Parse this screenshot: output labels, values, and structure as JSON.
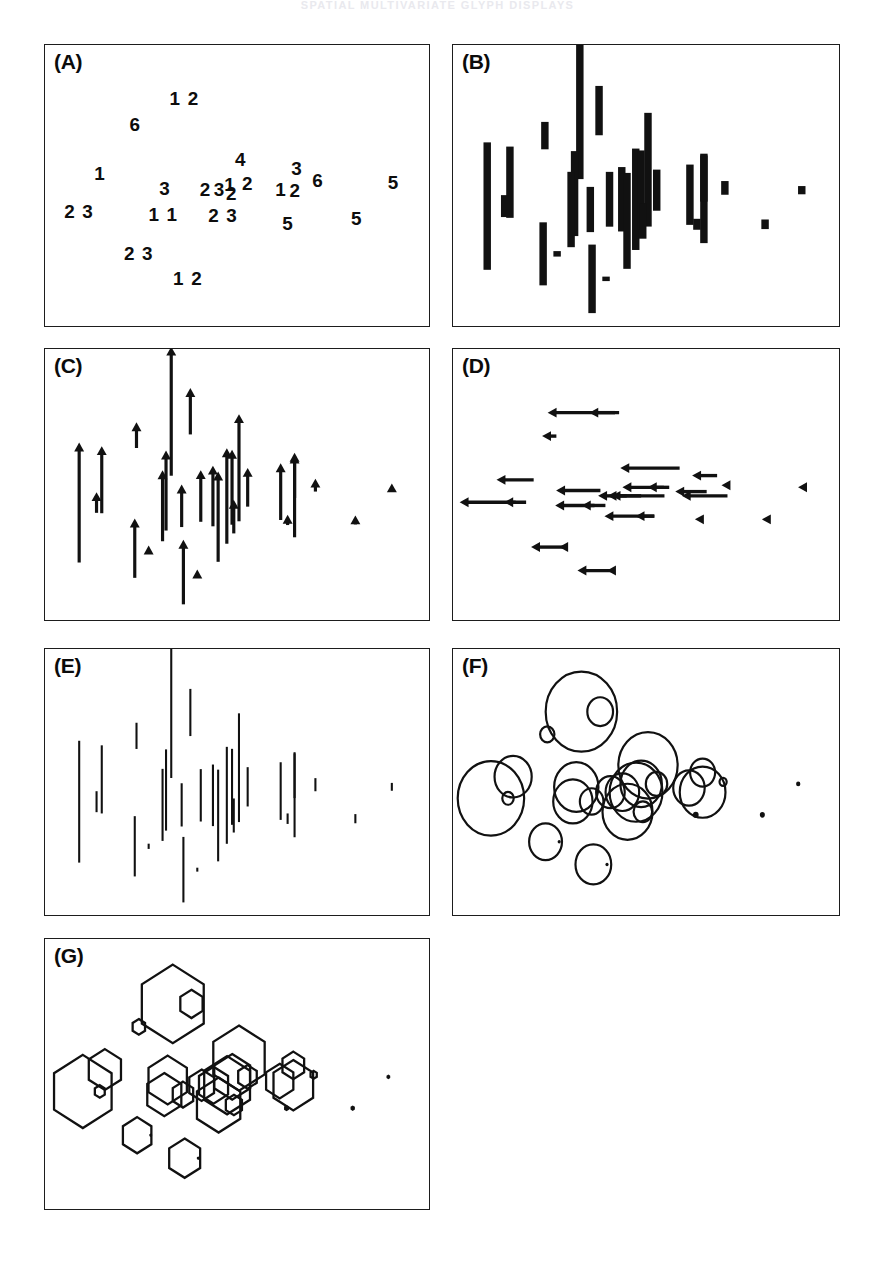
{
  "page": {
    "running_head": "SPATIAL MULTIVARIATE GLYPH DISPLAYS",
    "width": 875,
    "height": 1265,
    "ink_color": "#111111",
    "paper_color": "#ffffff"
  },
  "figure": {
    "panel_count": 7,
    "panel_geometry": [
      {
        "key": "A",
        "x": 44,
        "y": 44,
        "w": 386,
        "h": 283
      },
      {
        "key": "B",
        "x": 452,
        "y": 44,
        "w": 388,
        "h": 283
      },
      {
        "key": "C",
        "x": 44,
        "y": 348,
        "w": 386,
        "h": 273
      },
      {
        "key": "D",
        "x": 452,
        "y": 348,
        "w": 388,
        "h": 273
      },
      {
        "key": "E",
        "x": 44,
        "y": 648,
        "w": 386,
        "h": 268
      },
      {
        "key": "F",
        "x": 452,
        "y": 648,
        "w": 388,
        "h": 268
      },
      {
        "key": "G",
        "x": 44,
        "y": 938,
        "w": 386,
        "h": 272
      }
    ],
    "panels": [
      {
        "key": "A",
        "label": "(A)",
        "glyph": "digit"
      },
      {
        "key": "B",
        "label": "(B)",
        "glyph": "thick-bar"
      },
      {
        "key": "C",
        "label": "(C)",
        "glyph": "up-arrow"
      },
      {
        "key": "D",
        "label": "(D)",
        "glyph": "left-arrow"
      },
      {
        "key": "E",
        "label": "(E)",
        "glyph": "thin-line"
      },
      {
        "key": "F",
        "label": "(F)",
        "glyph": "circle"
      },
      {
        "key": "G",
        "label": "(G)",
        "glyph": "hexagon"
      }
    ]
  },
  "chart_data": {
    "type": "scatter",
    "title": "",
    "subtitle": "",
    "xlabel": "",
    "ylabel": "",
    "xlim": [
      0,
      100
    ],
    "ylim": [
      0,
      100
    ],
    "grid": false,
    "legend": "none",
    "note": "Seven panels show the same set of spatial sites encoded by seven different glyph types. Panel A prints a category digit at each site; panels B-G scale a glyph (bar, up-arrow, left-arrow, thin line, circle, hexagon) by the site value.",
    "sites": [
      {
        "id": 1,
        "x": 10.5,
        "y": 54.5,
        "digit": "1",
        "value": 0.52
      },
      {
        "id": 2,
        "x": 4.0,
        "y": 44.0,
        "digit": "2",
        "value": 0.93
      },
      {
        "id": 3,
        "x": 9.0,
        "y": 44.0,
        "digit": "3",
        "value": 0.16
      },
      {
        "id": 4,
        "x": 20.5,
        "y": 75.0,
        "digit": "6",
        "value": 0.2
      },
      {
        "id": 5,
        "x": 30.5,
        "y": 86.0,
        "digit": "1",
        "value": 1.0
      },
      {
        "id": 6,
        "x": 36.0,
        "y": 86.0,
        "digit": "2",
        "value": 0.36
      },
      {
        "id": 7,
        "x": 29.0,
        "y": 49.5,
        "digit": "3",
        "value": 0.62
      },
      {
        "id": 8,
        "x": 28.0,
        "y": 42.5,
        "digit": "1",
        "value": 0.55
      },
      {
        "id": 9,
        "x": 33.5,
        "y": 42.5,
        "digit": "1",
        "value": 0.33
      },
      {
        "id": 10,
        "x": 39.0,
        "y": 47.0,
        "digit": "2",
        "value": 0.4
      },
      {
        "id": 11,
        "x": 42.5,
        "y": 47.0,
        "digit": "3",
        "value": 0.47
      },
      {
        "id": 12,
        "x": 46.5,
        "y": 47.0,
        "digit": "2",
        "value": 0.74
      },
      {
        "id": 13,
        "x": 48.0,
        "y": 51.0,
        "digit": "1",
        "value": 0.58
      },
      {
        "id": 14,
        "x": 52.5,
        "y": 51.0,
        "digit": "2",
        "value": 0.3
      },
      {
        "id": 15,
        "x": 50.0,
        "y": 60.0,
        "digit": "4",
        "value": 0.83
      },
      {
        "id": 16,
        "x": 44.0,
        "y": 37.5,
        "digit": "2",
        "value": 0.7
      },
      {
        "id": 17,
        "x": 48.5,
        "y": 37.5,
        "digit": "3",
        "value": 0.26
      },
      {
        "id": 18,
        "x": 62.0,
        "y": 49.0,
        "digit": "1",
        "value": 0.44
      },
      {
        "id": 19,
        "x": 66.0,
        "y": 47.0,
        "digit": "2",
        "value": 0.64
      },
      {
        "id": 20,
        "x": 66.0,
        "y": 56.5,
        "digit": "3",
        "value": 0.35
      },
      {
        "id": 21,
        "x": 72.0,
        "y": 52.0,
        "digit": "6",
        "value": 0.1
      },
      {
        "id": 22,
        "x": 64.0,
        "y": 36.0,
        "digit": "5",
        "value": 0.08
      },
      {
        "id": 23,
        "x": 83.5,
        "y": 36.0,
        "digit": "5",
        "value": 0.07
      },
      {
        "id": 24,
        "x": 94.0,
        "y": 51.0,
        "digit": "5",
        "value": 0.06
      },
      {
        "id": 25,
        "x": 20.0,
        "y": 23.0,
        "digit": "2",
        "value": 0.46
      },
      {
        "id": 26,
        "x": 24.0,
        "y": 23.0,
        "digit": "3",
        "value": 0.04
      },
      {
        "id": 27,
        "x": 34.0,
        "y": 12.0,
        "digit": "1",
        "value": 0.5
      },
      {
        "id": 28,
        "x": 38.0,
        "y": 12.0,
        "digit": "2",
        "value": 0.03
      }
    ],
    "panel_a_digit_marks": [
      {
        "text": "1 2",
        "x": 34.5,
        "y": 87.0
      },
      {
        "text": "6",
        "x": 20.5,
        "y": 76.0
      },
      {
        "text": "4",
        "x": 50.5,
        "y": 61.0
      },
      {
        "text": "1",
        "x": 10.5,
        "y": 55.0
      },
      {
        "text": "3",
        "x": 66.5,
        "y": 57.0
      },
      {
        "text": "3",
        "x": 29.0,
        "y": 48.5
      },
      {
        "text": "2",
        "x": 40.5,
        "y": 48.0
      },
      {
        "text": "3",
        "x": 44.5,
        "y": 48.0
      },
      {
        "text": "2",
        "x": 48.0,
        "y": 46.5
      },
      {
        "text": "1",
        "x": 47.5,
        "y": 50.0
      },
      {
        "text": "2",
        "x": 52.5,
        "y": 50.5
      },
      {
        "text": "1",
        "x": 62.0,
        "y": 48.0
      },
      {
        "text": "2",
        "x": 66.0,
        "y": 47.5
      },
      {
        "text": "6",
        "x": 72.5,
        "y": 52.0
      },
      {
        "text": "5",
        "x": 94.0,
        "y": 51.0
      },
      {
        "text": "2 3",
        "x": 4.5,
        "y": 38.5
      },
      {
        "text": "1 1",
        "x": 28.5,
        "y": 37.5
      },
      {
        "text": "2 3",
        "x": 45.5,
        "y": 37.0
      },
      {
        "text": "5",
        "x": 64.0,
        "y": 33.5
      },
      {
        "text": "5",
        "x": 83.5,
        "y": 35.5
      },
      {
        "text": "2 3",
        "x": 21.5,
        "y": 20.5
      },
      {
        "text": "1 2",
        "x": 35.5,
        "y": 10.0
      }
    ],
    "series": [
      {
        "name": "panel B — thick vertical bars",
        "glyph": "thick-bar",
        "values": [
          0.52,
          0.93,
          0.16,
          0.2,
          1.0,
          0.36,
          0.62,
          0.55,
          0.33,
          0.4,
          0.47,
          0.74,
          0.58,
          0.3,
          0.83,
          0.7,
          0.26,
          0.44,
          0.64,
          0.35,
          0.1,
          0.08,
          0.07,
          0.06,
          0.46,
          0.04,
          0.5,
          0.03
        ]
      },
      {
        "name": "panel C — upward arrows",
        "glyph": "up-arrow",
        "values": [
          0.52,
          0.93,
          0.16,
          0.2,
          1.0,
          0.36,
          0.62,
          0.55,
          0.33,
          0.4,
          0.47,
          0.74,
          0.58,
          0.3,
          0.83,
          0.7,
          0.26,
          0.44,
          0.64,
          0.35,
          0.1,
          0.08,
          0.07,
          0.06,
          0.46,
          0.04,
          0.5,
          0.03
        ]
      },
      {
        "name": "panel D — leftward arrows",
        "glyph": "left-arrow",
        "values": [
          0.52,
          0.93,
          0.16,
          0.2,
          1.0,
          0.36,
          0.62,
          0.55,
          0.33,
          0.4,
          0.47,
          0.74,
          0.58,
          0.3,
          0.83,
          0.7,
          0.26,
          0.44,
          0.64,
          0.35,
          0.1,
          0.08,
          0.07,
          0.06,
          0.46,
          0.04,
          0.5,
          0.03
        ]
      },
      {
        "name": "panel E — thin vertical lines",
        "glyph": "thin-line",
        "values": [
          0.52,
          0.93,
          0.16,
          0.2,
          1.0,
          0.36,
          0.62,
          0.55,
          0.33,
          0.4,
          0.47,
          0.74,
          0.58,
          0.3,
          0.83,
          0.7,
          0.26,
          0.44,
          0.64,
          0.35,
          0.1,
          0.08,
          0.07,
          0.06,
          0.46,
          0.04,
          0.5,
          0.03
        ]
      },
      {
        "name": "panel F — circles sized by value",
        "glyph": "circle",
        "values": [
          0.52,
          0.93,
          0.16,
          0.2,
          1.0,
          0.36,
          0.62,
          0.55,
          0.33,
          0.4,
          0.47,
          0.74,
          0.58,
          0.3,
          0.83,
          0.7,
          0.26,
          0.44,
          0.64,
          0.35,
          0.1,
          0.08,
          0.07,
          0.06,
          0.46,
          0.04,
          0.5,
          0.03
        ]
      },
      {
        "name": "panel G — hexagons sized by value",
        "glyph": "hexagon",
        "values": [
          0.52,
          0.93,
          0.16,
          0.2,
          1.0,
          0.36,
          0.62,
          0.55,
          0.33,
          0.4,
          0.47,
          0.74,
          0.58,
          0.3,
          0.83,
          0.7,
          0.26,
          0.44,
          0.64,
          0.35,
          0.1,
          0.08,
          0.07,
          0.06,
          0.46,
          0.04,
          0.5,
          0.03
        ]
      }
    ]
  }
}
